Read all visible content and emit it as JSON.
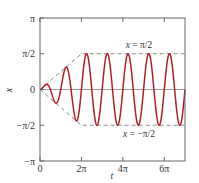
{
  "chart_data": {
    "type": "line",
    "title": "",
    "xlabel": "t",
    "ylabel": "x",
    "xlim_pi": [
      0,
      7
    ],
    "ylim_pi": [
      -1,
      1
    ],
    "grid": false,
    "legend": "none",
    "x_ticks": [
      {
        "value_pi": 0,
        "label": "0"
      },
      {
        "value_pi": 2,
        "label": "2π"
      },
      {
        "value_pi": 4,
        "label": "4π"
      },
      {
        "value_pi": 6,
        "label": "6π"
      }
    ],
    "y_ticks": [
      {
        "value_pi": 1,
        "label": "π"
      },
      {
        "value_pi": 0.5,
        "label": "π/2"
      },
      {
        "value_pi": 0,
        "label": "0"
      },
      {
        "value_pi": -0.5,
        "label": "−π/2"
      },
      {
        "value_pi": -1,
        "label": "−π"
      }
    ],
    "series": [
      {
        "name": "x(t)",
        "color": "#b0202a",
        "description": "Oscillation x = A(t)·sin(2t); amplitude A grows linearly from 0 at t=0 to π/2 at t=2π, then stays at π/2",
        "angular_frequency": 2,
        "amplitude_final_pi": 0.5,
        "ramp_end_t_pi": 2
      }
    ],
    "reference_lines": [
      {
        "name": "upper-envelope",
        "style": "dashed",
        "color": "#808080",
        "points_pi": [
          [
            0,
            0
          ],
          [
            2,
            0.5
          ],
          [
            7,
            0.5
          ]
        ]
      },
      {
        "name": "lower-envelope",
        "style": "dashed",
        "color": "#808080",
        "points_pi": [
          [
            0,
            0
          ],
          [
            2,
            -0.5
          ],
          [
            7,
            -0.5
          ]
        ]
      },
      {
        "name": "zero-line",
        "style": "solid",
        "color": "#808080",
        "points_pi": [
          [
            0,
            0
          ],
          [
            7,
            0
          ]
        ]
      }
    ],
    "annotations": [
      {
        "name": "upper-label",
        "var": "x",
        "text": " = π/2"
      },
      {
        "name": "lower-label",
        "var": "x",
        "text": " = −π/2"
      }
    ]
  }
}
